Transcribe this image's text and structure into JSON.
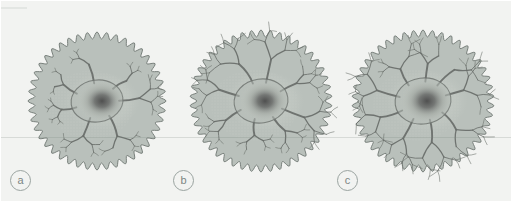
{
  "figure": {
    "name": "three-panel-cell-morphology-figure",
    "background_color": "#f2f3f1",
    "width": 512,
    "height": 202,
    "scanline_label": ""
  },
  "palette": {
    "page_background": "#f2f3f1",
    "cell_fill": "#b9c0bb",
    "cell_outline": "#6e7672",
    "cytoplasm_fill": "#b2bab4",
    "soma_halo": "#c6ccc6",
    "nucleus_dark": "#4a4a4a",
    "dendrite_stroke": "#6a6f6b",
    "label_text": "#7c8683",
    "label_ring": "#9aa3a0",
    "stipple": "#cdd3cd",
    "scanline": "#78827d"
  },
  "panels": [
    {
      "id": "panel-a",
      "label": "a",
      "label_x": 9,
      "label_y": 169,
      "center_x": 96,
      "center_y": 100,
      "outer_radius": 69,
      "scallop_count": 44,
      "scallop_depth": 3.4,
      "soma_rx": 26,
      "soma_ry": 21,
      "nucleus_rx": 13,
      "nucleus_ry": 11,
      "nucleus_offset_x": 5,
      "nucleus_offset_y": 0,
      "branch_seed": 11,
      "branch_scale": 0.92,
      "branch_count": 7,
      "description": "smallest arbor"
    },
    {
      "id": "panel-b",
      "label": "b",
      "label_x": 172,
      "label_y": 169,
      "center_x": 260,
      "center_y": 100,
      "outer_radius": 71,
      "scallop_count": 46,
      "scallop_depth": 3.4,
      "soma_rx": 27,
      "soma_ry": 22,
      "nucleus_rx": 13,
      "nucleus_ry": 11,
      "nucleus_offset_x": 4,
      "nucleus_offset_y": 0,
      "branch_seed": 27,
      "branch_scale": 1.0,
      "branch_count": 8,
      "description": "medium arbor"
    },
    {
      "id": "panel-c",
      "label": "c",
      "label_x": 336,
      "label_y": 169,
      "center_x": 422,
      "center_y": 100,
      "outer_radius": 71,
      "scallop_count": 46,
      "scallop_depth": 3.4,
      "soma_rx": 28,
      "soma_ry": 23,
      "nucleus_rx": 14,
      "nucleus_ry": 12,
      "nucleus_offset_x": 4,
      "nucleus_offset_y": 0,
      "branch_seed": 41,
      "branch_scale": 1.06,
      "branch_count": 9,
      "description": "largest arbor"
    }
  ]
}
